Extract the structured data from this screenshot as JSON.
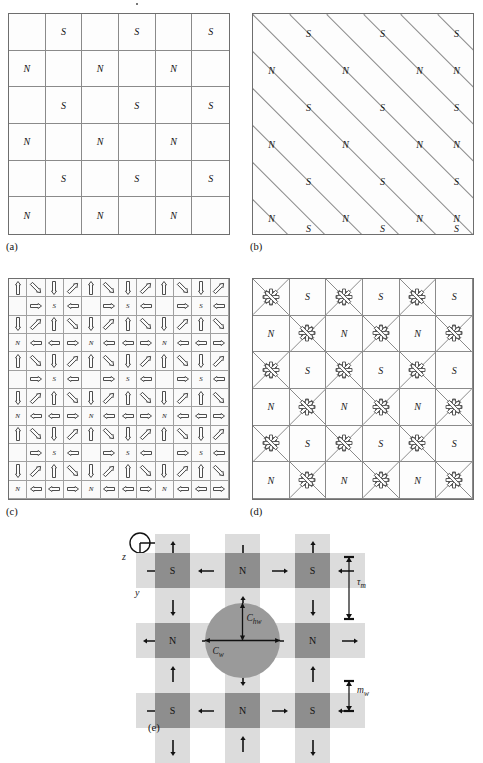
{
  "figure": {
    "panel_labels": [
      "(a)",
      "(b)",
      "(c)",
      "(d)",
      "(e)"
    ]
  },
  "colors": {
    "line": "#8a8a8a",
    "border": "#6e6e6e",
    "cell_fill": "#fdfdfd",
    "magnet_dark": "#8e8e8e",
    "magnet_light": "#dcdcdc",
    "coil": "#9a9a9a",
    "text": "#111111"
  },
  "panel_a": {
    "label": "(a)",
    "rows": 6,
    "cols": 6,
    "poles": [
      [
        "",
        "S",
        "",
        "S",
        "",
        "S"
      ],
      [
        "N",
        "",
        "N",
        "",
        "N",
        ""
      ],
      [
        "",
        "S",
        "",
        "S",
        "",
        "S"
      ],
      [
        "N",
        "",
        "N",
        "",
        "N",
        ""
      ],
      [
        "",
        "S",
        "",
        "S",
        "",
        "S"
      ],
      [
        "N",
        "",
        "N",
        "",
        "N",
        ""
      ]
    ]
  },
  "panel_b": {
    "label": "(b)",
    "rows": 6,
    "cols": 6,
    "pattern": "diagonal-diamond-lattice",
    "poles": [
      [
        "",
        "S",
        "",
        "S",
        "",
        "S"
      ],
      [
        "N",
        "",
        "N",
        "",
        "N",
        "N"
      ],
      [
        "",
        "S",
        "",
        "S",
        "",
        "S"
      ],
      [
        "N",
        "",
        "N",
        "",
        "N",
        "N"
      ],
      [
        "",
        "S",
        "",
        "S",
        "",
        "S"
      ],
      [
        "N",
        "",
        "N",
        "",
        "N",
        "N"
      ]
    ],
    "edge_bottom_poles": [
      "",
      "S",
      "",
      "S",
      "",
      "S"
    ]
  },
  "panel_c": {
    "label": "(c)",
    "rows": 12,
    "cols": 12,
    "pattern": "halbach-arrow-array",
    "pole_positions": [
      {
        "row": 1,
        "col": 2,
        "pole": "S"
      },
      {
        "row": 1,
        "col": 6,
        "pole": "S"
      },
      {
        "row": 1,
        "col": 10,
        "pole": "S"
      },
      {
        "row": 3,
        "col": 0,
        "pole": "N"
      },
      {
        "row": 3,
        "col": 4,
        "pole": "N"
      },
      {
        "row": 3,
        "col": 8,
        "pole": "N"
      },
      {
        "row": 5,
        "col": 2,
        "pole": "S"
      },
      {
        "row": 5,
        "col": 6,
        "pole": "S"
      },
      {
        "row": 5,
        "col": 10,
        "pole": "S"
      },
      {
        "row": 7,
        "col": 0,
        "pole": "N"
      },
      {
        "row": 7,
        "col": 4,
        "pole": "N"
      },
      {
        "row": 7,
        "col": 8,
        "pole": "N"
      },
      {
        "row": 9,
        "col": 2,
        "pole": "S"
      },
      {
        "row": 9,
        "col": 6,
        "pole": "S"
      },
      {
        "row": 9,
        "col": 10,
        "pole": "S"
      },
      {
        "row": 11,
        "col": 0,
        "pole": "N"
      },
      {
        "row": 11,
        "col": 4,
        "pole": "N"
      },
      {
        "row": 11,
        "col": 8,
        "pole": "N"
      }
    ]
  },
  "panel_d": {
    "label": "(d)",
    "rows": 6,
    "cols": 6,
    "pattern": "pole-cells-alternating-with-eight-way-starburst",
    "poles": [
      [
        "",
        "S",
        "",
        "S",
        "",
        "S"
      ],
      [
        "N",
        "",
        "N",
        "",
        "N",
        ""
      ],
      [
        "",
        "S",
        "",
        "S",
        "",
        "S"
      ],
      [
        "N",
        "",
        "N",
        "",
        "N",
        ""
      ],
      [
        "",
        "S",
        "",
        "S",
        "",
        "S"
      ],
      [
        "N",
        "",
        "N",
        "",
        "N",
        ""
      ]
    ],
    "starburst_outward_note": "outward arrows on even rows, inward arrows on odd rows"
  },
  "panel_e": {
    "label": "(e)",
    "axes": {
      "x": "x",
      "y": "y",
      "z": "z"
    },
    "dimensions": [
      {
        "symbol": "τ",
        "sub": "m",
        "text": "τ"
      },
      {
        "symbol": "m",
        "sub": "w",
        "text": "m"
      }
    ],
    "dim_tau_m": "τ",
    "dim_tau_m_sub": "m",
    "dim_m_w": "m",
    "dim_m_w_sub": "w",
    "coil_width_label": "C",
    "coil_width_sub": "w",
    "coil_halfwidth_label": "C",
    "coil_halfwidth_sub": "hw",
    "magnets": [
      [
        "S",
        "N",
        "S"
      ],
      [
        "N",
        "",
        "N"
      ],
      [
        "S",
        "N",
        "S"
      ]
    ],
    "pole_grid_note": "3x3 dark magnet blocks with light interstitial blocks carrying magnetization arrows; central circular coil overlays middle"
  }
}
